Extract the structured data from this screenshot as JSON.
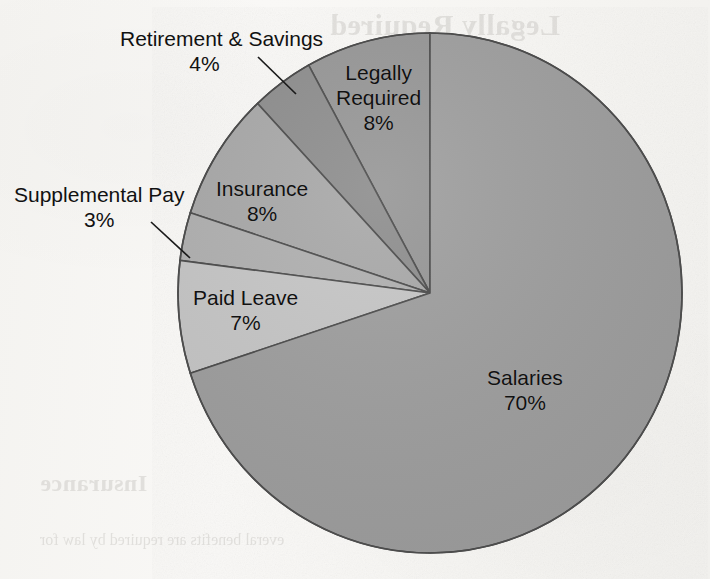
{
  "chart_data": {
    "type": "pie",
    "title": "",
    "subtitle": "",
    "xlabel": "",
    "ylabel": "",
    "grid": false,
    "legend_position": "none",
    "label_format": "name + percent",
    "start_angle_deg": 0,
    "direction": "counterclockwise",
    "categories": [
      "Salaries",
      "Paid Leave",
      "Supplemental Pay",
      "Insurance",
      "Retirement & Savings",
      "Legally Required"
    ],
    "values": [
      70,
      7,
      3,
      8,
      4,
      8
    ],
    "slices": [
      {
        "name": "Legally Required",
        "percent": 8,
        "percent_label": "8%",
        "color": "#969696",
        "label_lines": [
          "Legally",
          "Required",
          "8%"
        ],
        "label_placement": "inside"
      },
      {
        "name": "Retirement & Savings",
        "percent": 4,
        "percent_label": "4%",
        "color": "#8d8d8d",
        "label_lines": [
          "Retirement & Savings",
          "4%"
        ],
        "label_placement": "outside-leader"
      },
      {
        "name": "Insurance",
        "percent": 8,
        "percent_label": "8%",
        "color": "#a8a8a8",
        "label_lines": [
          "Insurance",
          "8%"
        ],
        "label_placement": "inside"
      },
      {
        "name": "Supplemental Pay",
        "percent": 3,
        "percent_label": "3%",
        "color": "#b0b0b0",
        "label_lines": [
          "Supplemental Pay",
          "3%"
        ],
        "label_placement": "outside-leader"
      },
      {
        "name": "Paid Leave",
        "percent": 7,
        "percent_label": "7%",
        "color": "#c6c6c6",
        "label_lines": [
          "Paid Leave",
          "7%"
        ],
        "label_placement": "inside"
      },
      {
        "name": "Salaries",
        "percent": 70,
        "percent_label": "70%",
        "color": "#9e9e9e",
        "label_lines": [
          "Salaries",
          "70%"
        ],
        "label_placement": "inside"
      }
    ],
    "total_percent": 100,
    "outline_color": "#4a4a4a",
    "background_color": "#f7f6f4"
  },
  "labels": {
    "retirement": {
      "name": "Retirement & Savings",
      "percent": "4%"
    },
    "legally": {
      "line1": "Legally",
      "line2": "Required",
      "percent": "8%"
    },
    "insurance": {
      "name": "Insurance",
      "percent": "8%"
    },
    "supplemental": {
      "name": "Supplemental Pay",
      "percent": "3%"
    },
    "paidleave": {
      "name": "Paid Leave",
      "percent": "7%"
    },
    "salaries": {
      "name": "Salaries",
      "percent": "70%"
    }
  },
  "bleed_through": {
    "heading": "Legally Required",
    "para1_l1": "yees and to their employ-",
    "para1_l2": "ons, and to the U.S.",
    "para1_l3": "e is considered part",
    "para2_l1": "es have unique",
    "para2_l2": "control of their work",
    "para2_l3": "s, so they are",
    "para2_l4": "ss (Jones, 2001).",
    "para2_l5": "al. Legal requ",
    "para2_l6": "vary by state, city",
    "heading2": "Insurance",
    "para3_l1": "everal benefits are required by law for"
  }
}
